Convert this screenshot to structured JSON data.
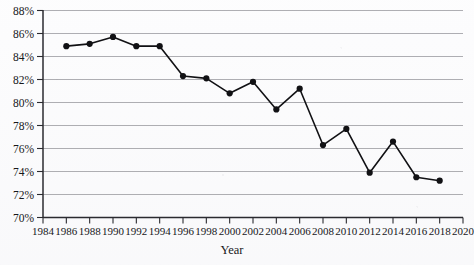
{
  "chart_data": {
    "type": "line",
    "title": "",
    "xlabel": "Year",
    "ylabel": "",
    "xlim": [
      1984,
      2020
    ],
    "ylim": [
      70,
      88
    ],
    "grid": true,
    "legend": "none",
    "x_tick_labels": [
      "1984",
      "1986",
      "1988",
      "1990",
      "1992",
      "1994",
      "1996",
      "1998",
      "2000",
      "2002",
      "2004",
      "2006",
      "2008",
      "2010",
      "2012",
      "2014",
      "2016",
      "2018",
      "2020"
    ],
    "x_ticks": [
      1984,
      1986,
      1988,
      1990,
      1992,
      1994,
      1996,
      1998,
      2000,
      2002,
      2004,
      2006,
      2008,
      2010,
      2012,
      2014,
      2016,
      2018,
      2020
    ],
    "y_tick_labels": [
      "70%",
      "72%",
      "74%",
      "76%",
      "78%",
      "80%",
      "82%",
      "84%",
      "86%",
      "88%"
    ],
    "y_ticks": [
      70,
      72,
      74,
      76,
      78,
      80,
      82,
      84,
      86,
      88
    ],
    "x": [
      1986,
      1988,
      1990,
      1992,
      1994,
      1996,
      1998,
      2000,
      2002,
      2004,
      2006,
      2008,
      2010,
      2012,
      2014,
      2016,
      2018
    ],
    "values": [
      84.9,
      85.1,
      85.7,
      84.9,
      84.9,
      82.3,
      82.1,
      80.8,
      81.8,
      79.4,
      81.2,
      76.3,
      77.7,
      73.9,
      76.6,
      73.5,
      73.2
    ],
    "marker": "filled-circle",
    "series_color": "#111114",
    "grid_color": "#8d8d92",
    "axis_color": "#2b2b30"
  },
  "axis": {
    "x_title": "Year"
  }
}
